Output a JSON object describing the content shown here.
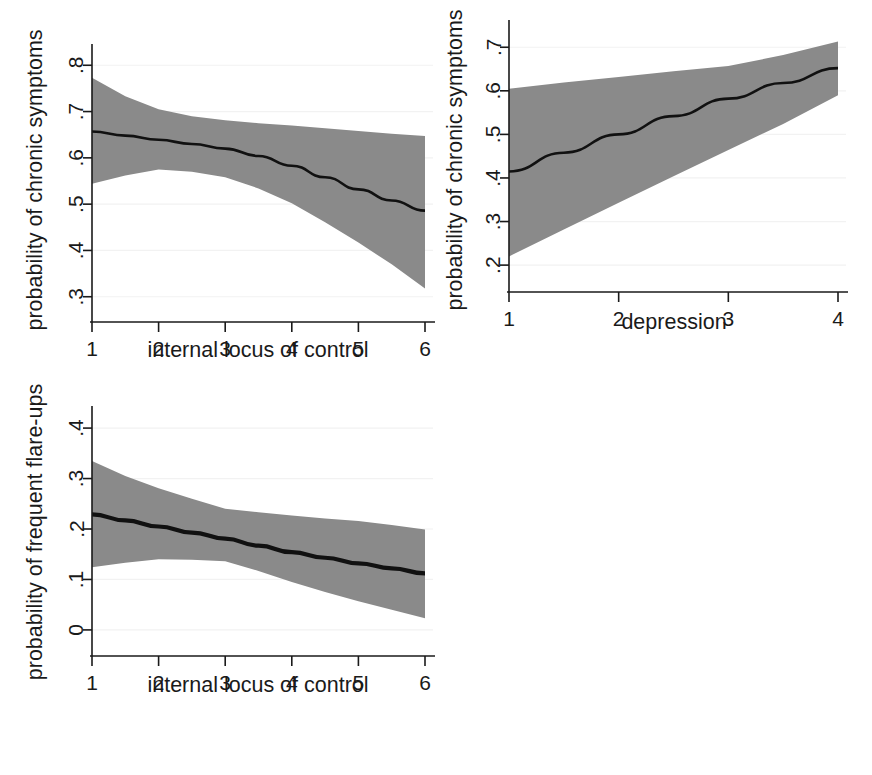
{
  "figure": {
    "background_color": "#ffffff",
    "band_color": "#8a8a8a",
    "line_color": "#111111",
    "axis_color": "#1a1a1a",
    "grid_color": "#f2f2f2",
    "panel_count": 3
  },
  "chart_data": [
    {
      "id": "panel-1",
      "type": "line",
      "title": "",
      "xlabel": "internal locus of control",
      "ylabel": "probability of chronic symptoms",
      "xlim": [
        1,
        6
      ],
      "ylim": [
        0.28,
        0.82
      ],
      "xticks": [
        1,
        2,
        3,
        4,
        5,
        6
      ],
      "xticklabels": [
        "1",
        "2",
        "3",
        "4",
        "5",
        "6"
      ],
      "yticks": [
        0.3,
        0.4,
        0.5,
        0.6,
        0.7,
        0.8
      ],
      "yticklabels": [
        ".3",
        ".4",
        ".5",
        ".6",
        ".7",
        ".8"
      ],
      "grid": true,
      "legend": "none",
      "x": [
        1,
        1.5,
        2,
        2.5,
        3,
        3.5,
        4,
        4.5,
        5,
        5.5,
        6
      ],
      "series": [
        {
          "name": "predicted probability",
          "values": [
            0.657,
            0.648,
            0.639,
            0.63,
            0.62,
            0.604,
            0.583,
            0.558,
            0.532,
            0.508,
            0.486
          ]
        }
      ],
      "ci_upper": [
        0.773,
        0.733,
        0.705,
        0.69,
        0.681,
        0.675,
        0.67,
        0.664,
        0.658,
        0.652,
        0.647
      ],
      "ci_lower": [
        0.544,
        0.562,
        0.575,
        0.57,
        0.558,
        0.534,
        0.502,
        0.461,
        0.417,
        0.37,
        0.318
      ]
    },
    {
      "id": "panel-2",
      "type": "line",
      "title": "",
      "xlabel": "depression",
      "ylabel": "probability of chronic symptoms",
      "xlim": [
        1,
        4
      ],
      "ylim": [
        0.175,
        0.735
      ],
      "xticks": [
        1,
        2,
        3,
        4
      ],
      "xticklabels": [
        "1",
        "2",
        "3",
        "4"
      ],
      "yticks": [
        0.2,
        0.3,
        0.4,
        0.5,
        0.6,
        0.7
      ],
      "yticklabels": [
        ".2",
        ".3",
        ".4",
        ".5",
        ".6",
        ".7"
      ],
      "grid": true,
      "legend": "none",
      "x": [
        1,
        1.5,
        2,
        2.5,
        3,
        3.5,
        4
      ],
      "series": [
        {
          "name": "predicted probability",
          "values": [
            0.415,
            0.458,
            0.5,
            0.542,
            0.582,
            0.618,
            0.652
          ]
        }
      ],
      "ci_upper": [
        0.605,
        0.619,
        0.632,
        0.645,
        0.657,
        0.682,
        0.713
      ],
      "ci_lower": [
        0.22,
        0.282,
        0.343,
        0.404,
        0.464,
        0.524,
        0.59
      ]
    },
    {
      "id": "panel-3",
      "type": "line",
      "title": "",
      "xlabel": "internal locus of control",
      "ylabel": "probability of frequent flare-ups",
      "xlim": [
        1,
        6
      ],
      "ylim": [
        -0.02,
        0.42
      ],
      "xticks": [
        1,
        2,
        3,
        4,
        5,
        6
      ],
      "xticklabels": [
        "1",
        "2",
        "3",
        "4",
        "5",
        "6"
      ],
      "yticks": [
        0,
        0.1,
        0.2,
        0.3,
        0.4
      ],
      "yticklabels": [
        "0",
        ".1",
        ".2",
        ".3",
        ".4"
      ],
      "grid": true,
      "legend": "none",
      "x": [
        1,
        1.5,
        2,
        2.5,
        3,
        3.5,
        4,
        4.5,
        5,
        5.5,
        6
      ],
      "series": [
        {
          "name": "predicted probability",
          "values": [
            0.229,
            0.217,
            0.205,
            0.193,
            0.181,
            0.167,
            0.154,
            0.143,
            0.132,
            0.122,
            0.112
          ]
        }
      ],
      "ci_upper": [
        0.335,
        0.305,
        0.281,
        0.26,
        0.24,
        0.233,
        0.227,
        0.221,
        0.216,
        0.208,
        0.199
      ],
      "ci_lower": [
        0.124,
        0.133,
        0.14,
        0.139,
        0.136,
        0.117,
        0.095,
        0.075,
        0.057,
        0.04,
        0.023
      ]
    }
  ]
}
